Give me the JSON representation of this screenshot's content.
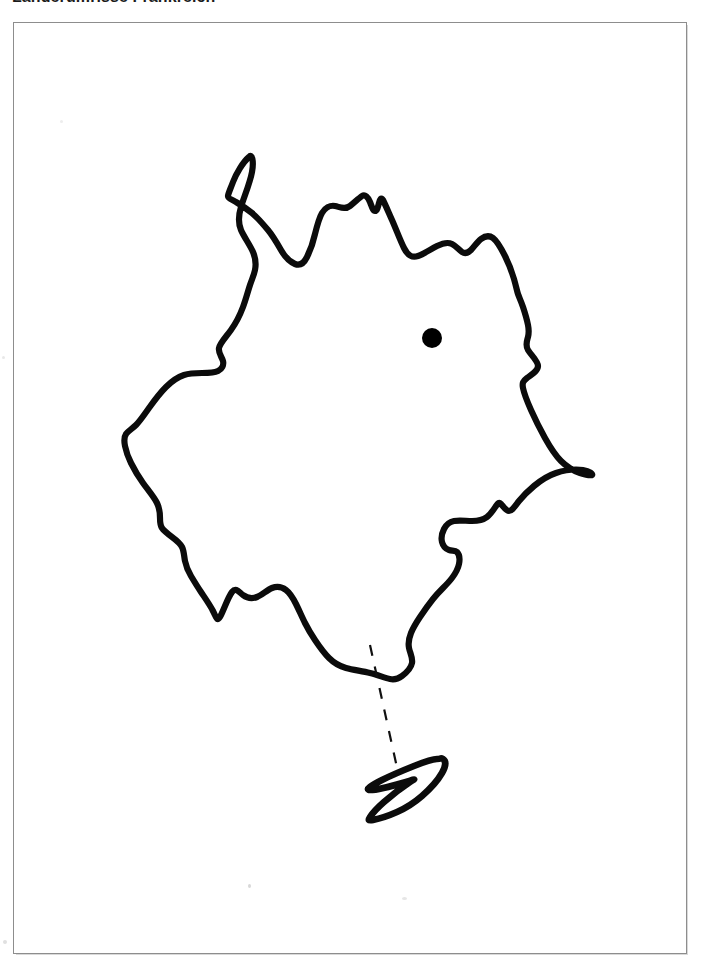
{
  "document": {
    "title": "Länderumrisse Frankreich",
    "language": "de",
    "background_color": "#ffffff",
    "frame_border_color": "#8d8d8d",
    "ink_color": "#0b0b0b"
  },
  "map": {
    "name": "France outline map",
    "country_label": "Frankreich",
    "outline_style": "hand-drawn black contour, unlabeled",
    "capital_marker": {
      "name": "capital-dot",
      "shape": "filled circle",
      "color": "#000000",
      "center_x": 432,
      "center_y": 338,
      "radius": 10,
      "label": ""
    },
    "island": {
      "name": "Korsika",
      "label": "",
      "outline_style": "small closed contour south-east of the mainland"
    },
    "leader_line": {
      "name": "island-leader-line",
      "style": "dashed",
      "color": "#111111",
      "dash_pattern": "11 11",
      "from_x": 370,
      "from_y": 645,
      "to_x": 398,
      "to_y": 772
    },
    "paths": {
      "mainland": "M 249 157 C 243 162 236 174 233 182 C 230 190 228 194 228 196 C 228 198 232 200 236 202 C 241 205 247 209 252 213 C 258 218 263 224 268 230 C 273 236 277 243 281 250 C 285 257 290 262 295 264 C 300 266 304 263 307 257 C 310 251 313 243 315 234 C 317 226 319 218 322 213 C 325 208 330 205 335 206 C 340 207 345 210 350 206 C 355 202 359 198 362 196 C 365 194 368 197 370 202 C 372 207 373 211 375 211 C 377 211 378 207 379 203 C 380 199 381 197 383 200 C 385 204 388 211 392 220 C 396 229 400 240 404 248 C 408 256 412 258 418 256 C 424 254 431 249 437 246 C 443 243 448 242 452 244 C 456 246 459 250 462 252 C 465 254 468 253 471 250 C 474 247 477 242 481 239 C 485 236 489 235 493 238 C 497 241 501 248 505 256 C 509 264 512 272 514 279 C 516 286 517 291 518 294 C 519 297 521 301 523 307 C 525 313 527 320 528 325 C 529 330 529 333 528 337 C 527 341 525 345 528 350 C 531 355 538 361 538 366 C 538 371 531 375 527 378 C 523 381 522 383 523 388 C 524 393 527 401 531 410 C 535 419 540 429 545 438 C 550 447 555 455 561 461 C 567 467 574 471 580 473 C 586 475 591 476 592 475 C 593 474 590 471 583 470 C 576 469 565 470 556 473 C 547 476 540 481 534 486 C 528 491 523 496 519 501 C 515 506 512 511 509 511 C 506 511 503 506 501 504 C 499 502 498 503 496 506 C 494 509 491 514 487 517 C 483 520 478 521 472 521 C 466 521 459 520 454 521 C 449 522 446 525 444 529 C 442 533 441 538 442 542 C 443 546 446 549 449 550 C 452 551 455 550 457 552 C 459 554 460 559 459 564 C 458 569 455 574 452 578 C 449 582 446 585 443 588 C 440 591 437 594 433 599 C 429 604 424 611 420 617 C 416 623 413 628 411 633 C 409 638 408 643 409 648 C 410 653 413 658 412 663 C 411 668 406 673 402 676 C 398 679 395 680 390 679 C 385 678 378 675 370 673 C 362 671 353 670 346 668 C 339 666 334 663 329 658 C 324 653 319 646 315 640 C 311 634 308 629 305 623 C 302 617 299 610 296 604 C 293 598 290 593 286 590 C 282 587 277 586 272 588 C 267 590 262 595 257 597 C 252 599 247 598 243 595 C 239 592 236 587 232 592 C 228 597 223 612 220 617 C 217 622 216 617 213 611 C 210 605 205 598 201 592 C 197 586 194 581 191 576 C 188 571 186 566 185 561 C 184 556 184 551 182 547 C 180 543 176 540 172 537 C 168 534 164 531 162 528 C 160 525 160 522 160 518 C 160 514 160 509 157 503 C 154 497 148 490 143 483 C 138 476 134 469 131 463 C 128 457 126 451 125 446 C 124 441 124 437 126 434 C 128 431 132 429 136 425 C 140 421 144 415 149 408 C 154 401 160 393 166 387 C 172 381 178 377 184 375 C 190 373 196 373 202 373 C 208 373 214 373 218 371 C 222 369 224 365 223 361 C 222 357 218 353 219 348 C 220 343 226 337 231 330 C 236 323 240 315 243 307 C 246 299 248 291 250 285 C 252 279 254 275 255 270 C 256 265 256 259 253 252 C 250 245 244 237 241 230 C 238 223 238 217 241 207 C 244 197 250 183 252 172 C 254 161 252 153 249 157 Z",
      "island": "M 437 759 C 432 759 424 762 414 766 C 404 770 392 775 382 780 C 372 785 364 790 370 790 C 376 790 396 785 406 782 C 416 779 416 778 410 782 C 404 786 392 795 384 802 C 376 809 372 814 370 817 C 368 820 368 821 373 820 C 378 819 388 816 397 812 C 406 808 414 803 422 796 C 430 789 438 780 442 773 C 446 766 446 761 443 759 C 440 757 442 759 437 759 Z"
    }
  }
}
